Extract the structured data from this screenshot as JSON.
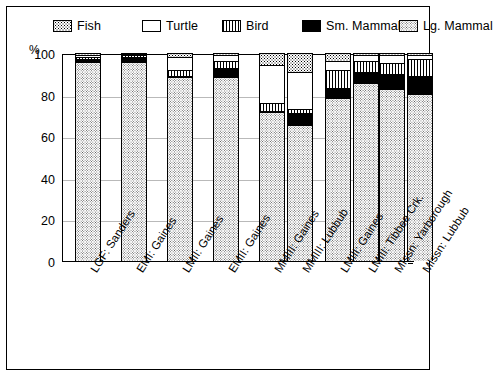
{
  "legend": {
    "items": [
      {
        "label": "Fish",
        "pattern": "p-fish"
      },
      {
        "label": "Turtle",
        "pattern": "p-turtle"
      },
      {
        "label": "Bird",
        "pattern": "p-bird"
      },
      {
        "label": "Sm. Mammal",
        "pattern": "p-smmam"
      },
      {
        "label": "Lg. Mammal",
        "pattern": "p-lgmam"
      }
    ]
  },
  "axis": {
    "unit_label": "%",
    "yticks": [
      "100",
      "80",
      "60",
      "40",
      "20",
      "0"
    ]
  },
  "chart_data": {
    "type": "bar",
    "title": "",
    "xlabel": "",
    "ylabel": "%",
    "ylim": [
      0,
      100
    ],
    "stacked": true,
    "grid": true,
    "legend_position": "top",
    "categories": [
      "LGF: Sanders",
      "EMI: Gaines",
      "LMII: Gaines",
      "EMII: Gaines",
      "MMIII: Gaines",
      "MMIII: Lubbub",
      "LMIII: Gaines",
      "LMIII: Tibbee Crk.",
      "MIssn: Yarborough",
      "MIssn: Lubbub"
    ],
    "series": [
      {
        "name": "Lg. Mammal",
        "pattern": "p-lgmam",
        "values": [
          95,
          95,
          88,
          88,
          71,
          65,
          78,
          85,
          82,
          80
        ]
      },
      {
        "name": "Sm. Mammal",
        "pattern": "p-smmam",
        "values": [
          2,
          3,
          1,
          5,
          1,
          6,
          5,
          6,
          8,
          9
        ]
      },
      {
        "name": "Bird",
        "pattern": "p-bird",
        "values": [
          1,
          1,
          3,
          3,
          4,
          2,
          9,
          5,
          5,
          8
        ]
      },
      {
        "name": "Turtle",
        "pattern": "p-turtle",
        "values": [
          1,
          0.5,
          6,
          3,
          18,
          18,
          4,
          3,
          4,
          2
        ]
      },
      {
        "name": "Fish",
        "pattern": "p-fish",
        "values": [
          1,
          0.5,
          2,
          1,
          6,
          9,
          4,
          1,
          1,
          1
        ]
      }
    ]
  }
}
